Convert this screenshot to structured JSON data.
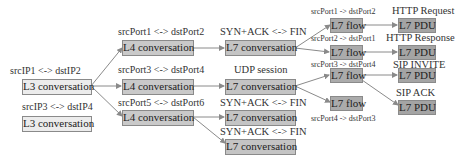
{
  "diagram": {
    "l3": [
      {
        "label": "L3 conversation",
        "caption": "srcIP1 <-> dstIP2"
      },
      {
        "label": "L3 conversation",
        "caption": "srcIP3 <-> dstIP4"
      }
    ],
    "l4": [
      {
        "label": "L4 conversation",
        "caption": "srcPort1 <-> dstPort2"
      },
      {
        "label": "L4 conversation",
        "caption": "srcPort3 <-> dstPort4"
      },
      {
        "label": "L4 conversation",
        "caption": "srcPort5 <-> dstPort6"
      }
    ],
    "l7conv": [
      {
        "label": "L7 conversation",
        "caption": "SYN+ACK <-> FIN"
      },
      {
        "label": "L7 conversation",
        "caption": "UDP session"
      },
      {
        "label": "L7 conversation",
        "caption": "SYN+ACK <-> FIN"
      },
      {
        "label": "L7 conversation",
        "caption": "SYN+ACK <-> FIN"
      }
    ],
    "l7flow": [
      {
        "label": "L7 flow",
        "caption": "srcPort1 -> dstPort2"
      },
      {
        "label": "L7 flow",
        "caption": "srcPort2 -> dstPort1"
      },
      {
        "label": "L7 flow",
        "caption": "srcPort3 -> dstPort4"
      },
      {
        "label": "L7 flow",
        "caption": "srcPort4 -> dstPort3"
      }
    ],
    "pdu": [
      {
        "label": "L7 PDU",
        "caption": "HTTP Request"
      },
      {
        "label": "L7 PDU",
        "caption": "HTTP Response"
      },
      {
        "label": "L7 PDU",
        "caption": "SIP INVITE"
      },
      {
        "label": "L7 PDU",
        "caption": "SIP ACK"
      }
    ],
    "colors": {
      "l3_fill": "#ececec",
      "l4_fill": "#c9c9c9",
      "l7_conversation_fill": "#c4c4c4",
      "l7_flow_fill": "#ababab",
      "pdu_fill": "#a4a4a4",
      "edge": "#8a8a8a"
    }
  }
}
